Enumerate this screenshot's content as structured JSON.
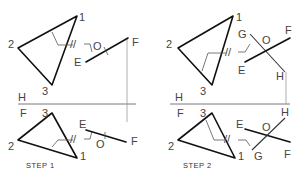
{
  "reference_line": {
    "upper_label": "H",
    "lower_label": "F"
  },
  "steps": [
    {
      "caption": "STEP 1",
      "top_view": {
        "vertices": {
          "v1": "1",
          "v2": "2",
          "v3": "3"
        },
        "line_labels": {
          "e": "E",
          "f": "F",
          "o": "O"
        },
        "parallel_mark": "//"
      },
      "front_view": {
        "vertices": {
          "v1": "1",
          "v2": "2",
          "v3": "3"
        },
        "line_labels": {
          "e": "E",
          "f": "F",
          "o": "O"
        },
        "parallel_mark": "//"
      },
      "ref_labels": {
        "h": "H",
        "f": "F"
      }
    },
    {
      "caption": "STEP 2",
      "top_view": {
        "vertices": {
          "v1": "1",
          "v2": "2",
          "v3": "3"
        },
        "line_labels": {
          "e": "E",
          "f": "F",
          "o": "O",
          "g": "G",
          "h": "H"
        },
        "parallel_mark": "//"
      },
      "front_view": {
        "vertices": {
          "v1": "1",
          "v2": "2",
          "v3": "3"
        },
        "line_labels": {
          "e": "E",
          "f": "F",
          "o": "O",
          "g": "G",
          "h": "H"
        },
        "parallel_mark": "//"
      },
      "ref_labels": {
        "h": "H",
        "f": "F"
      }
    }
  ]
}
